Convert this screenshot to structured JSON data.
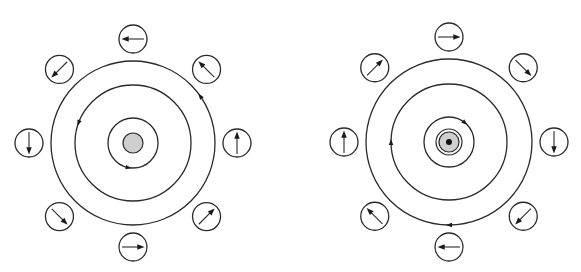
{
  "figures": [
    {
      "id": "left",
      "center": [
        133,
        143
      ],
      "core": {
        "radius": 10,
        "fill": "#cfcfcf",
        "dot": false
      },
      "rings": [
        {
          "radius": 25,
          "arrow_angle_deg": 100,
          "direction": "ccw"
        },
        {
          "radius": 58,
          "arrow_angle_deg": 200,
          "direction": "ccw"
        },
        {
          "radius": 82,
          "arrow_angle_deg": -35,
          "direction": "ccw"
        }
      ],
      "compass_radius": 104,
      "compass_size": 14,
      "compasses": [
        {
          "position": "top",
          "angle_deg": -90,
          "needle_deg": 180
        },
        {
          "position": "top-right",
          "angle_deg": -45,
          "needle_deg": -135
        },
        {
          "position": "right",
          "angle_deg": 0,
          "needle_deg": -90
        },
        {
          "position": "bottom-right",
          "angle_deg": 45,
          "needle_deg": -45
        },
        {
          "position": "bottom",
          "angle_deg": 90,
          "needle_deg": 0
        },
        {
          "position": "bottom-left",
          "angle_deg": 135,
          "needle_deg": 45
        },
        {
          "position": "left",
          "angle_deg": 180,
          "needle_deg": 90
        },
        {
          "position": "top-left",
          "angle_deg": -135,
          "needle_deg": 135
        }
      ]
    },
    {
      "id": "right",
      "center": [
        449,
        142
      ],
      "core": {
        "radius": 10,
        "fill": "#cfcfcf",
        "dot": true
      },
      "rings": [
        {
          "radius": 25,
          "arrow_angle_deg": -50,
          "direction": "cw"
        },
        {
          "radius": 58,
          "arrow_angle_deg": 180,
          "direction": "cw"
        },
        {
          "radius": 83,
          "arrow_angle_deg": 90,
          "direction": "cw"
        }
      ],
      "compass_radius": 105,
      "compass_size": 14,
      "compasses": [
        {
          "position": "top",
          "angle_deg": -90,
          "needle_deg": 0
        },
        {
          "position": "top-right",
          "angle_deg": -45,
          "needle_deg": 45
        },
        {
          "position": "right",
          "angle_deg": 0,
          "needle_deg": 90
        },
        {
          "position": "bottom-right",
          "angle_deg": 45,
          "needle_deg": 135
        },
        {
          "position": "bottom",
          "angle_deg": 90,
          "needle_deg": 180
        },
        {
          "position": "bottom-left",
          "angle_deg": 135,
          "needle_deg": -135
        },
        {
          "position": "left",
          "angle_deg": 180,
          "needle_deg": -90
        },
        {
          "position": "top-left",
          "angle_deg": -135,
          "needle_deg": -45
        }
      ]
    }
  ],
  "colors": {
    "stroke": "#2a2a2a",
    "core_fill": "#cfcfcf",
    "background": "#ffffff"
  }
}
